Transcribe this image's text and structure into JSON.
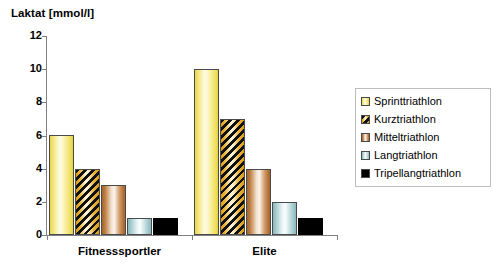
{
  "chart_data": {
    "type": "bar",
    "title": "",
    "ylabel": "Laktat [mmol/l]",
    "xlabel": "",
    "ylim": [
      0,
      12
    ],
    "yticks": [
      0,
      2,
      4,
      6,
      8,
      10,
      12
    ],
    "grid": false,
    "legend_position": "right",
    "categories": [
      "Fitnesssportler",
      "Elite"
    ],
    "series": [
      {
        "name": "Sprinttriathlon",
        "values": [
          6,
          10
        ],
        "color": "#FDF3A8",
        "pattern": "solid"
      },
      {
        "name": "Kurztriathlon",
        "values": [
          4,
          7
        ],
        "color": "#E8B33B",
        "pattern": "diagonal-hatch"
      },
      {
        "name": "Mitteltriathlon",
        "values": [
          3,
          4
        ],
        "color": "#C08B5C",
        "pattern": "solid"
      },
      {
        "name": "Langtriathlon",
        "values": [
          1,
          2
        ],
        "color": "#BFDCDE",
        "pattern": "solid"
      },
      {
        "name": "Tripellangtriathlon",
        "values": [
          1,
          1
        ],
        "color": "#000000",
        "pattern": "solid"
      }
    ]
  },
  "axis": {
    "y_title": "Laktat [mmol/l]",
    "y_tick_labels": [
      "12",
      "10",
      "8",
      "6",
      "4",
      "2",
      "0"
    ],
    "x_tick_labels": [
      "Fitnesssportler",
      "Elite"
    ]
  },
  "legend": {
    "items": [
      {
        "label": "Sprinttriathlon"
      },
      {
        "label": "Kurztriathlon"
      },
      {
        "label": "Mitteltriathlon"
      },
      {
        "label": "Langtriathlon"
      },
      {
        "label": "Tripellangtriathlon"
      }
    ]
  }
}
